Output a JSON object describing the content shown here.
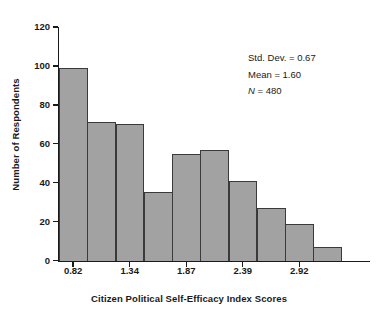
{
  "chart_data": {
    "type": "bar",
    "title": "",
    "xlabel": "Citizen Political Self-Efficacy Index Scores",
    "ylabel": "Number of Respondents",
    "ylim": [
      0,
      120
    ],
    "grid": false,
    "legend": null,
    "bar_count": 11,
    "categories": [
      "1",
      "2",
      "3",
      "4",
      "5",
      "6",
      "7",
      "8",
      "9",
      "10",
      "11"
    ],
    "values": [
      99,
      71,
      70,
      35,
      55,
      57,
      41,
      27,
      19,
      7,
      0
    ],
    "bars": [
      {
        "index": 1,
        "value": 99
      },
      {
        "index": 2,
        "value": 71
      },
      {
        "index": 3,
        "value": 70
      },
      {
        "index": 4,
        "value": 35
      },
      {
        "index": 5,
        "value": 55
      },
      {
        "index": 6,
        "value": 57
      },
      {
        "index": 7,
        "value": 41
      },
      {
        "index": 8,
        "value": 27
      },
      {
        "index": 9,
        "value": 19
      },
      {
        "index": 10,
        "value": 7
      },
      {
        "index": 11,
        "value": 0
      }
    ],
    "y_ticks": [
      0,
      20,
      40,
      60,
      80,
      100,
      120
    ],
    "y_tick_labels": [
      "0",
      "20",
      "40",
      "60",
      "80",
      "100",
      "120"
    ],
    "x_tick_labels": [
      "0.82",
      "1.34",
      "1.87",
      "2.39",
      "2.92"
    ],
    "x_tick_bar_index": [
      1,
      3,
      5,
      7,
      9
    ],
    "bar_fill_color": "#a2a2a2",
    "bar_edge_color": "#3a3a3a",
    "axis_color": "#1a1a1a",
    "background_color": "#ffffff",
    "annotations": [
      {
        "label": "Std. Dev. = 0.67",
        "prefix": "Std. Dev. = ",
        "value": "0.67"
      },
      {
        "label": "Mean = 1.60",
        "prefix": "Mean = ",
        "value": "1.60"
      },
      {
        "label": "N = 480",
        "prefix": "N = ",
        "value": "480",
        "italic_prefix": "N"
      }
    ]
  },
  "axes": {
    "y_title": "Number of Respondents",
    "x_title": "Citizen Political Self-Efficacy Index Scores"
  },
  "stats": {
    "std_dev_line": "Std. Dev. = 0.67",
    "mean_line": "Mean = 1.60",
    "n_symbol": "N",
    "n_value": " = 480"
  }
}
